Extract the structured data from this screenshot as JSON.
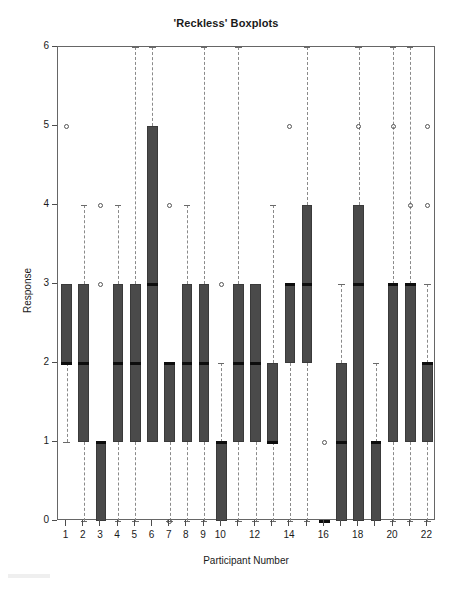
{
  "chart_data": {
    "type": "box",
    "title": "'Reckless' Boxplots",
    "xlabel": "Participant Number",
    "ylabel": "Response",
    "ylim": [
      0,
      6
    ],
    "xlim": [
      0.5,
      22.5
    ],
    "yticks": [
      0,
      1,
      2,
      3,
      4,
      5,
      6
    ],
    "ytick_labels": [
      "0",
      "1",
      "2",
      "3",
      "4",
      "5",
      "6"
    ],
    "xticks": [
      1,
      2,
      3,
      4,
      5,
      6,
      7,
      8,
      9,
      10,
      11,
      12,
      13,
      14,
      15,
      16,
      17,
      18,
      19,
      20,
      21,
      22
    ],
    "xtick_labels": [
      "1",
      "2",
      "3",
      "4",
      "5",
      "6",
      "7",
      "8",
      "9",
      "10",
      "",
      "12",
      "",
      "14",
      "",
      "16",
      "",
      "18",
      "",
      "20",
      "",
      "22"
    ],
    "grid": false,
    "legend": null,
    "box_fill": "#4a4a4a",
    "median_color": "#0d0d0d",
    "whisker_color": "#8a8a8a",
    "outlier_color": "#555555",
    "boxes": [
      {
        "category": "1",
        "whisker_low": 1,
        "q1": 2,
        "median": 2,
        "q3": 3,
        "whisker_high": 3,
        "outliers": [
          5
        ]
      },
      {
        "category": "2",
        "whisker_low": 0,
        "q1": 1,
        "median": 2,
        "q3": 3,
        "whisker_high": 4,
        "outliers": []
      },
      {
        "category": "3",
        "whisker_low": 0,
        "q1": 0,
        "median": 1,
        "q3": 1,
        "whisker_high": 1,
        "outliers": [
          3,
          4
        ]
      },
      {
        "category": "4",
        "whisker_low": 0,
        "q1": 1,
        "median": 2,
        "q3": 3,
        "whisker_high": 4,
        "outliers": []
      },
      {
        "category": "5",
        "whisker_low": 0,
        "q1": 1,
        "median": 2,
        "q3": 3,
        "whisker_high": 6,
        "outliers": []
      },
      {
        "category": "6",
        "whisker_low": 1,
        "q1": 1,
        "median": 3,
        "q3": 5,
        "whisker_high": 6,
        "outliers": []
      },
      {
        "category": "7",
        "whisker_low": 0,
        "q1": 1,
        "median": 2,
        "q3": 2,
        "whisker_high": 2,
        "outliers": [
          0,
          4
        ]
      },
      {
        "category": "8",
        "whisker_low": 0,
        "q1": 1,
        "median": 2,
        "q3": 3,
        "whisker_high": 4,
        "outliers": []
      },
      {
        "category": "9",
        "whisker_low": 0,
        "q1": 1,
        "median": 2,
        "q3": 3,
        "whisker_high": 6,
        "outliers": []
      },
      {
        "category": "10",
        "whisker_low": 0,
        "q1": 0,
        "median": 1,
        "q3": 1,
        "whisker_high": 2,
        "outliers": [
          3
        ]
      },
      {
        "category": "11",
        "whisker_low": 0,
        "q1": 1,
        "median": 2,
        "q3": 3,
        "whisker_high": 6,
        "outliers": []
      },
      {
        "category": "12",
        "whisker_low": 0,
        "q1": 1,
        "median": 2,
        "q3": 3,
        "whisker_high": 3,
        "outliers": []
      },
      {
        "category": "13",
        "whisker_low": 0,
        "q1": 1,
        "median": 1,
        "q3": 2,
        "whisker_high": 4,
        "outliers": []
      },
      {
        "category": "14",
        "whisker_low": 0,
        "q1": 2,
        "median": 3,
        "q3": 3,
        "whisker_high": 3,
        "outliers": [
          5
        ]
      },
      {
        "category": "15",
        "whisker_low": 0,
        "q1": 2,
        "median": 3,
        "q3": 4,
        "whisker_high": 6,
        "outliers": []
      },
      {
        "category": "16",
        "whisker_low": 0,
        "q1": 0,
        "median": 0,
        "q3": 0,
        "whisker_high": 0,
        "outliers": [
          1
        ]
      },
      {
        "category": "17",
        "whisker_low": 0,
        "q1": 0,
        "median": 1,
        "q3": 2,
        "whisker_high": 3,
        "outliers": []
      },
      {
        "category": "18",
        "whisker_low": 0,
        "q1": 0,
        "median": 3,
        "q3": 4,
        "whisker_high": 6,
        "outliers": [
          5
        ]
      },
      {
        "category": "19",
        "whisker_low": 0,
        "q1": 0,
        "median": 1,
        "q3": 1,
        "whisker_high": 2,
        "outliers": []
      },
      {
        "category": "20",
        "whisker_low": 0,
        "q1": 1,
        "median": 3,
        "q3": 3,
        "whisker_high": 6,
        "outliers": [
          5
        ]
      },
      {
        "category": "21",
        "whisker_low": 0,
        "q1": 1,
        "median": 3,
        "q3": 3,
        "whisker_high": 6,
        "outliers": [
          4
        ]
      },
      {
        "category": "22",
        "whisker_low": 0,
        "q1": 1,
        "median": 2,
        "q3": 2,
        "whisker_high": 3,
        "outliers": [
          4,
          5
        ]
      }
    ]
  }
}
